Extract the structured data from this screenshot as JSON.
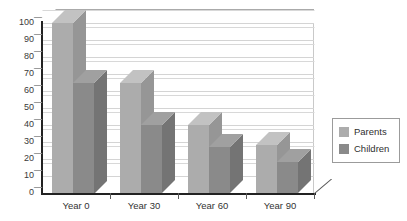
{
  "chart_data": {
    "type": "bar",
    "title": "",
    "subtitle": "",
    "xlabel": "",
    "ylabel": "",
    "categories": [
      "Year 0",
      "Year 30",
      "Year 60",
      "Year 90"
    ],
    "series": [
      {
        "name": "Parents",
        "values": [
          100,
          65,
          40,
          28
        ],
        "color": "#ACACAC"
      },
      {
        "name": "Children",
        "values": [
          65,
          40,
          27,
          18
        ],
        "color": "#8A8A8A"
      }
    ],
    "ylim": [
      0,
      100
    ],
    "ytick_values": [
      0,
      10,
      20,
      30,
      40,
      50,
      60,
      70,
      80,
      90,
      100
    ],
    "ytick_labels": [
      "0",
      "10",
      "20",
      "30",
      "40",
      "50",
      "60",
      "70",
      "80",
      "90",
      "100"
    ],
    "grid": true,
    "grid_axis": "y",
    "legend_position": "right",
    "style": "3d-grouped-bar",
    "annotations": []
  },
  "colors": {
    "parents_front": "#ACACAC",
    "parents_top": "#C2C2C2",
    "parents_side": "#969696",
    "children_front": "#8A8A8A",
    "children_top": "#A0A0A0",
    "children_side": "#747474",
    "gridline": "#D4D4D4",
    "axis": "#222222",
    "plot_background": "#FFFFFF",
    "legend_border": "#9B9B9B",
    "tick_label": "#3A3A3A"
  },
  "legend": {
    "items": [
      {
        "label": "Parents"
      },
      {
        "label": "Children"
      }
    ]
  }
}
